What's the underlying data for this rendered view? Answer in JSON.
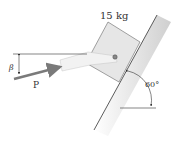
{
  "diagram": {
    "mass_label": "15 kg",
    "force_label": "P",
    "force_angle_label": "β",
    "incline_angle_label": "60°",
    "colors": {
      "block_fill": "#e6e6e6",
      "block_stroke": "#555555",
      "incline_fill": "#d8d8d8",
      "rod_fill": "#f0f0f0",
      "arrow": "#7a7a7a",
      "line": "#333333",
      "pin": "#888888"
    }
  }
}
